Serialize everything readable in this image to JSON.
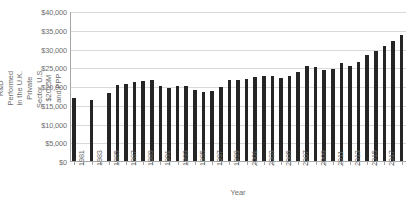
{
  "chart_data": {
    "type": "bar",
    "title": "",
    "subtitle": "",
    "xlabel": "Year",
    "ylabel": "Gross Domestic R&D Performed in the U.K. Private Sector, U.S. $2015M and PPP",
    "ylim": [
      0,
      40000
    ],
    "ytick_step": 5000,
    "ytick_labels": [
      "$0",
      "$5,000",
      "$10,000",
      "$15,000",
      "$20,000",
      "$25,000",
      "$30,000",
      "$35,000",
      "$40,000"
    ],
    "ytick_values": [
      0,
      5000,
      10000,
      15000,
      20000,
      25000,
      30000,
      35000,
      40000
    ],
    "grid": true,
    "legend": false,
    "legend_position": "none",
    "bar_color": "#252525",
    "gridline_color": "#d9d9d9",
    "axis_color": "#a6a6a6",
    "text_color": "#6d6d6d",
    "xtick_labels_shown": [
      "1981",
      "1983",
      "1985",
      "1987",
      "1989",
      "1991",
      "1993",
      "1995",
      "1997",
      "1999",
      "2001",
      "2003",
      "2005",
      "2007",
      "2009",
      "2011",
      "2013",
      "2015",
      "2017"
    ],
    "categories": [
      "1981",
      "1982",
      "1983",
      "1984",
      "1985",
      "1986",
      "1987",
      "1988",
      "1989",
      "1990",
      "1991",
      "1992",
      "1993",
      "1994",
      "1995",
      "1996",
      "1997",
      "1998",
      "1999",
      "2000",
      "2001",
      "2002",
      "2003",
      "2004",
      "2005",
      "2006",
      "2007",
      "2008",
      "2009",
      "2010",
      "2011",
      "2012",
      "2013",
      "2014",
      "2015",
      "2016",
      "2017",
      "2018"
    ],
    "values": [
      17100,
      null,
      16600,
      null,
      18400,
      20500,
      20800,
      21400,
      21600,
      21900,
      20200,
      19800,
      20400,
      20400,
      19100,
      18700,
      18900,
      19900,
      22000,
      22000,
      22200,
      22700,
      23000,
      23000,
      22400,
      22900,
      24000,
      25500,
      25300,
      24500,
      24700,
      26300,
      25500,
      26800,
      28500,
      29700,
      31000,
      32300
    ],
    "extra_last_bar_value": 33800
  }
}
